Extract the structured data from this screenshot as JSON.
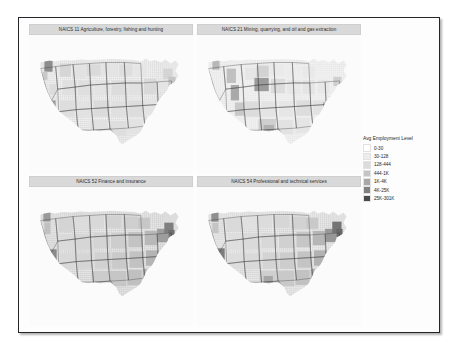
{
  "figure": {
    "background_color": "#fdfdfd",
    "frame_color": "#26262a"
  },
  "legend": {
    "title": "Avg Employment Level",
    "items": [
      {
        "label": "0-30",
        "color": "#ffffff"
      },
      {
        "label": "30-128",
        "color": "#ededed"
      },
      {
        "label": "128-444",
        "color": "#dcdcdc"
      },
      {
        "label": "444-1K",
        "color": "#c4c4c4"
      },
      {
        "label": "1K-4K",
        "color": "#a8a8a8"
      },
      {
        "label": "4K-25K",
        "color": "#818181"
      },
      {
        "label": "25K-301K",
        "color": "#4a4a4a"
      }
    ]
  },
  "panels": [
    {
      "strip_label": "NAICS 11 Agriculture, forestry, fishing and hunting"
    },
    {
      "strip_label": "NAICS 21 Mining, quarrying, and oil and gas extraction"
    },
    {
      "strip_label": "NAICS 52 Finance and insurance"
    },
    {
      "strip_label": "NAICS 54 Professional and technical services"
    }
  ],
  "chart_data": {
    "type": "heatmap",
    "title": "",
    "subtitle": "",
    "xlabel": "",
    "ylabel": "",
    "grid": false,
    "legend_position": "right",
    "facet_variable": "NAICS sector",
    "facet_layout": "2x2",
    "geography": "United States counties (contiguous 48 states) with state boundary overlay",
    "value_variable": "Avg Employment Level",
    "scale_type": "binned sequential grey",
    "bins": [
      {
        "label": "0-30",
        "min": 0,
        "max": 30,
        "color": "#ffffff"
      },
      {
        "label": "30-128",
        "min": 30,
        "max": 128,
        "color": "#ededed"
      },
      {
        "label": "128-444",
        "min": 128,
        "max": 444,
        "color": "#dcdcdc"
      },
      {
        "label": "444-1K",
        "min": 444,
        "max": 1000,
        "color": "#c4c4c4"
      },
      {
        "label": "1K-4K",
        "min": 1000,
        "max": 4000,
        "color": "#a8a8a8"
      },
      {
        "label": "4K-25K",
        "min": 4000,
        "max": 25000,
        "color": "#818181"
      },
      {
        "label": "25K-301K",
        "min": 25000,
        "max": 301000,
        "color": "#4a4a4a"
      }
    ],
    "series": [
      {
        "name": "NAICS 11 Agriculture, forestry, fishing and hunting",
        "notes": "Mostly light/low values; darker clusters in California Central Valley, coastal Washington and parts of the upper Midwest."
      },
      {
        "name": "NAICS 21 Mining, quarrying, and oil and gas extraction",
        "notes": "Very light nationwide; darker clusters in Wyoming, west Texas, Appalachia, and parts of the Rocky Mountain states."
      },
      {
        "name": "NAICS 52 Finance and insurance",
        "notes": "Broadly mid-grey with dark metro counties along the Northeast corridor, Florida, Great Lakes and California."
      },
      {
        "name": "NAICS 54 Professional and technical services",
        "notes": "Broadly mid-grey with the darkest counties around major metros in the Northeast, California, Texas and Florida."
      }
    ]
  }
}
